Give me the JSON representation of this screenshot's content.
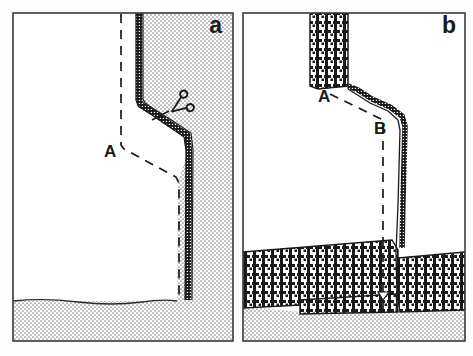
{
  "figure": {
    "background_color": "#fdfdfd",
    "frame_color": "#3a3a3a",
    "ink_color": "#1a1a1a",
    "width": 473,
    "height": 356
  },
  "panels": [
    {
      "id": "a",
      "label": "a",
      "label_x": 222,
      "label_y": 33,
      "annotations": [
        {
          "name": "point-a",
          "text": "A",
          "x": 104,
          "y": 157
        }
      ],
      "icons": [
        {
          "name": "scissors-icon",
          "x": 166,
          "y": 101,
          "size": 26,
          "rotation": -28
        }
      ],
      "textures": [
        {
          "name": "stipple-fill",
          "description": "fine stipple / sandstone"
        }
      ]
    },
    {
      "id": "b",
      "label": "b",
      "label_x": 448,
      "label_y": 33,
      "annotations": [
        {
          "name": "point-a",
          "text": "A",
          "x": 320,
          "y": 102
        },
        {
          "name": "point-b",
          "text": "B",
          "x": 376,
          "y": 134
        }
      ],
      "icons": [],
      "textures": [
        {
          "name": "stipple-fill",
          "description": "fine stipple / sandstone"
        },
        {
          "name": "houndstooth-fill",
          "description": "coarse woven / conglomerate"
        }
      ]
    }
  ],
  "geometry": {
    "outer_frame": {
      "x": 8,
      "y": 8,
      "width": 457,
      "height": 338
    },
    "divider_x": 238,
    "panel_a": {
      "frame": {
        "x": 13,
        "y": 13,
        "width": 220,
        "height": 328
      },
      "thick_contact": "M139,13 L139,100 L141,104 L152,112 L168,122 L186,134 L188,150 L188,297",
      "dashed_line": "M121,14 L121,145 L123,148 L175,176 L178,181 L178,300",
      "leader": "M150,118 L168,110",
      "stipple_polygon": "139,13 233,13 233,341 13,341 13,300 178,300 178,181 188,150 186,134 152,112 141,104 139,100",
      "lower_contact": "M13,300 Q60,297 110,301 Q150,304 178,300"
    },
    "panel_b": {
      "frame": {
        "x": 243,
        "y": 13,
        "width": 222,
        "height": 328
      },
      "houndstooth_band": {
        "x": 310,
        "y": 13,
        "width": 38,
        "height": 73
      },
      "thick_contact": "M310,13 L310,86 L318,88 L348,86 L360,91 L400,110 L404,118 L402,250 L404,258",
      "dashed_line": "M348,87 L383,118 L383,312",
      "free_edge": "M348,86 L360,91 L400,110 L404,118 L402,250 L398,262 L396,312",
      "crosshatch_upper": "243,252 400,240 404,258 404,300 243,308",
      "crosshatch_lower": "300,300 404,292 465,285 465,312 300,314",
      "stipple_lower": "243,308 300,314 404,314 465,312 465,341 243,341"
    }
  },
  "colors": {
    "ink": "#1a1a1a",
    "frame": "#3a3a3a",
    "stipple": "#7d7d7d",
    "paper": "#ffffff",
    "page": "#fdfdfd"
  }
}
